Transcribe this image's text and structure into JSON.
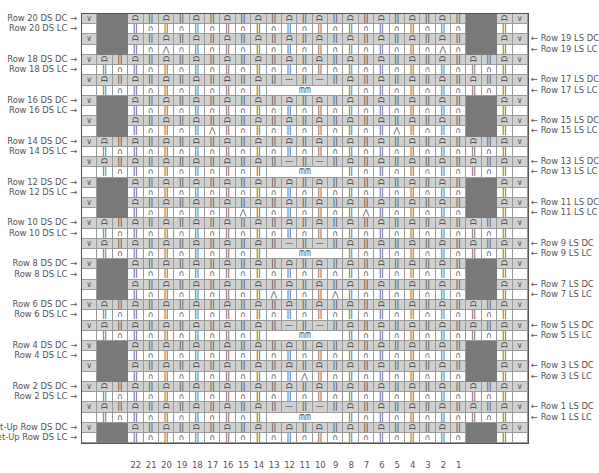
{
  "chart_title": "Knitting chart",
  "symbols": {
    "slip": "∨",
    "knit_pair_dc": "ᗩ",
    "knit_pair_lc": "∩",
    "rib": "ǀǀ",
    "purl": "—",
    "decrease": "⋀",
    "bobble": "ᗰᗰ"
  },
  "colors": {
    "dc_bg": "#d0d0d0",
    "lc_bg": "#ffffff",
    "no_stitch": "#7a7a7a",
    "grid": "#999999"
  },
  "column_numbers": [
    "22",
    "21",
    "20",
    "19",
    "18",
    "17",
    "16",
    "15",
    "14",
    "13",
    "12",
    "11",
    "10",
    "9",
    "8",
    "7",
    "6",
    "5",
    "4",
    "3",
    "2",
    "1"
  ],
  "left_labels": [
    {
      "text": "Row 20 DS DC →",
      "row": 0
    },
    {
      "text": "Row 20 DS LC →",
      "row": 1
    },
    {
      "text": "Row 18 DS DC →",
      "row": 4
    },
    {
      "text": "Row 18 DS LC →",
      "row": 5
    },
    {
      "text": "Row 16 DS DC →",
      "row": 8
    },
    {
      "text": "Row 16 DS LC →",
      "row": 9
    },
    {
      "text": "Row 14 DS DC →",
      "row": 12
    },
    {
      "text": "Row 14 DS LC →",
      "row": 13
    },
    {
      "text": "Row 12 DS DC →",
      "row": 16
    },
    {
      "text": "Row 12 DS LC →",
      "row": 17
    },
    {
      "text": "Row 10 DS DC →",
      "row": 20
    },
    {
      "text": "Row 10 DS LC →",
      "row": 21
    },
    {
      "text": "Row 8 DS DC →",
      "row": 24
    },
    {
      "text": "Row 8 DS LC →",
      "row": 25
    },
    {
      "text": "Row 6 DS DC →",
      "row": 28
    },
    {
      "text": "Row 6 DS LC →",
      "row": 29
    },
    {
      "text": "Row 4 DS DC →",
      "row": 32
    },
    {
      "text": "Row 4 DS LC →",
      "row": 33
    },
    {
      "text": "Row 2 DS DC →",
      "row": 36
    },
    {
      "text": "Row 2 DS LC →",
      "row": 37
    },
    {
      "text": "Set-Up Row DS DC →",
      "row": 40
    },
    {
      "text": "Set-Up Row DS LC →",
      "row": 41
    }
  ],
  "right_labels": [
    {
      "text": "← Row 19 LS DC",
      "row": 2
    },
    {
      "text": "← Row 19 LS LC",
      "row": 3
    },
    {
      "text": "← Row 17 LS DC",
      "row": 6
    },
    {
      "text": "← Row 17 LS LC",
      "row": 7
    },
    {
      "text": "← Row 15 LS DC",
      "row": 10
    },
    {
      "text": "← Row 15 LS LC",
      "row": 11
    },
    {
      "text": "← Row 13 LS DC",
      "row": 14
    },
    {
      "text": "← Row 13 LS LC",
      "row": 15
    },
    {
      "text": "← Row 11 LS DC",
      "row": 18
    },
    {
      "text": "← Row 11 LS LC",
      "row": 19
    },
    {
      "text": "← Row 9 LS DC",
      "row": 22
    },
    {
      "text": "← Row 9 LS LC",
      "row": 23
    },
    {
      "text": "← Row 7 LS DC",
      "row": 26
    },
    {
      "text": "← Row 7 LS LC",
      "row": 27
    },
    {
      "text": "← Row 5 LS DC",
      "row": 30
    },
    {
      "text": "← Row 5 LS LC",
      "row": 31
    },
    {
      "text": "← Row 3 LS DC",
      "row": 34
    },
    {
      "text": "← Row 3 LS LC",
      "row": 35
    },
    {
      "text": "← Row 1 LS DC",
      "row": 38
    },
    {
      "text": "← Row 1 LS LC",
      "row": 39
    }
  ],
  "wide_pairs": [
    2,
    3,
    6,
    7,
    10,
    11,
    14,
    15,
    18,
    19
  ],
  "decrease_rows": {
    "3": [
      2,
      20
    ],
    "11": [
      5,
      17
    ],
    "19": [
      7,
      15
    ],
    "27": [
      9,
      13
    ],
    "35": [
      11,
      11
    ]
  },
  "bobble_pairs": [
    3,
    7,
    11,
    15,
    19
  ]
}
